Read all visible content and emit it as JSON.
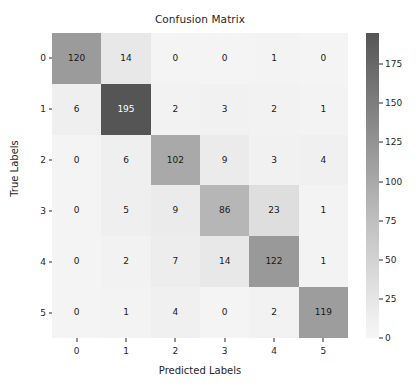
{
  "chart_data": {
    "type": "heatmap",
    "title": "Confusion Matrix",
    "xlabel": "Predicted Labels",
    "ylabel": "True Labels",
    "x_tick_labels": [
      "0",
      "1",
      "2",
      "3",
      "4",
      "5"
    ],
    "y_tick_labels": [
      "0",
      "1",
      "2",
      "3",
      "4",
      "5"
    ],
    "categories": [
      "0",
      "1",
      "2",
      "3",
      "4",
      "5"
    ],
    "matrix": [
      [
        120,
        14,
        0,
        0,
        1,
        0
      ],
      [
        6,
        195,
        2,
        3,
        2,
        1
      ],
      [
        0,
        6,
        102,
        9,
        3,
        4
      ],
      [
        0,
        5,
        9,
        86,
        23,
        1
      ],
      [
        0,
        2,
        7,
        14,
        122,
        1
      ],
      [
        0,
        1,
        4,
        0,
        2,
        119
      ]
    ],
    "rows": [
      {
        "label": "0",
        "cells": [
          {
            "value": "120",
            "level": 120,
            "color": "#9b9b9b",
            "dark": false
          },
          {
            "value": "14",
            "level": 14,
            "color": "#e8e8e8",
            "dark": false
          },
          {
            "value": "0",
            "level": 0,
            "color": "#f4f4f4",
            "dark": false
          },
          {
            "value": "0",
            "level": 0,
            "color": "#f4f4f4",
            "dark": false
          },
          {
            "value": "1",
            "level": 1,
            "color": "#f3f3f3",
            "dark": false
          },
          {
            "value": "0",
            "level": 0,
            "color": "#f4f4f4",
            "dark": false
          }
        ]
      },
      {
        "label": "1",
        "cells": [
          {
            "value": "6",
            "level": 6,
            "color": "#efefef",
            "dark": false
          },
          {
            "value": "195",
            "level": 195,
            "color": "#555555",
            "dark": true
          },
          {
            "value": "2",
            "level": 2,
            "color": "#f2f2f2",
            "dark": false
          },
          {
            "value": "3",
            "level": 3,
            "color": "#f1f1f1",
            "dark": false
          },
          {
            "value": "2",
            "level": 2,
            "color": "#f2f2f2",
            "dark": false
          },
          {
            "value": "1",
            "level": 1,
            "color": "#f3f3f3",
            "dark": false
          }
        ]
      },
      {
        "label": "2",
        "cells": [
          {
            "value": "0",
            "level": 0,
            "color": "#f4f4f4",
            "dark": false
          },
          {
            "value": "6",
            "level": 6,
            "color": "#efefef",
            "dark": false
          },
          {
            "value": "102",
            "level": 102,
            "color": "#a9a9a9",
            "dark": false
          },
          {
            "value": "9",
            "level": 9,
            "color": "#ebebeb",
            "dark": false
          },
          {
            "value": "3",
            "level": 3,
            "color": "#f1f1f1",
            "dark": false
          },
          {
            "value": "4",
            "level": 4,
            "color": "#f0f0f0",
            "dark": false
          }
        ]
      },
      {
        "label": "3",
        "cells": [
          {
            "value": "0",
            "level": 0,
            "color": "#f4f4f4",
            "dark": false
          },
          {
            "value": "5",
            "level": 5,
            "color": "#efefef",
            "dark": false
          },
          {
            "value": "9",
            "level": 9,
            "color": "#ebebeb",
            "dark": false
          },
          {
            "value": "86",
            "level": 86,
            "color": "#b6b6b6",
            "dark": false
          },
          {
            "value": "23",
            "level": 23,
            "color": "#dedede",
            "dark": false
          },
          {
            "value": "1",
            "level": 1,
            "color": "#f3f3f3",
            "dark": false
          }
        ]
      },
      {
        "label": "4",
        "cells": [
          {
            "value": "0",
            "level": 0,
            "color": "#f4f4f4",
            "dark": false
          },
          {
            "value": "2",
            "level": 2,
            "color": "#f2f2f2",
            "dark": false
          },
          {
            "value": "7",
            "level": 7,
            "color": "#ededed",
            "dark": false
          },
          {
            "value": "14",
            "level": 14,
            "color": "#e8e8e8",
            "dark": false
          },
          {
            "value": "122",
            "level": 122,
            "color": "#999999",
            "dark": false
          },
          {
            "value": "1",
            "level": 1,
            "color": "#f3f3f3",
            "dark": false
          }
        ]
      },
      {
        "label": "5",
        "cells": [
          {
            "value": "0",
            "level": 0,
            "color": "#f4f4f4",
            "dark": false
          },
          {
            "value": "1",
            "level": 1,
            "color": "#f3f3f3",
            "dark": false
          },
          {
            "value": "4",
            "level": 4,
            "color": "#f0f0f0",
            "dark": false
          },
          {
            "value": "0",
            "level": 0,
            "color": "#f4f4f4",
            "dark": false
          },
          {
            "value": "2",
            "level": 2,
            "color": "#f2f2f2",
            "dark": false
          },
          {
            "value": "119",
            "level": 119,
            "color": "#9d9d9d",
            "dark": false
          }
        ]
      }
    ],
    "colorbar": {
      "orientation": "vertical",
      "position": "right",
      "vmin": 0,
      "vmax": 195,
      "tick_values": [
        175,
        150,
        125,
        100,
        75,
        50,
        25,
        0
      ],
      "tick_labels": [
        "175",
        "150",
        "125",
        "100",
        "75",
        "50",
        "25",
        "0"
      ],
      "colormap": "greys",
      "color_low": "#f7f7f7",
      "color_high": "#555555"
    },
    "grid": false
  }
}
